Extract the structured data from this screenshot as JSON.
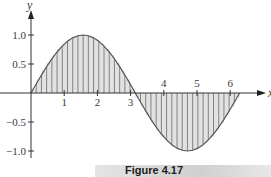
{
  "chart_data": {
    "type": "area",
    "title": "",
    "function": "sin(x)",
    "xlabel": "x",
    "ylabel": "y",
    "xlim": [
      0,
      6.283
    ],
    "ylim": [
      -1.0,
      1.0
    ],
    "x_ticks": [
      1,
      2,
      3,
      4,
      5,
      6
    ],
    "x_tick_labels": [
      "1",
      "2",
      "3",
      "4",
      "5",
      "6"
    ],
    "y_ticks": [
      1.0,
      0.5,
      -0.5,
      -1.0
    ],
    "y_tick_labels": [
      "1.0",
      "0.5",
      "−0.5",
      "−1.0"
    ],
    "num_strips": 40,
    "grid": false,
    "legend": null,
    "fill": "vertical strips between curve and x-axis",
    "x": [
      0,
      0.785,
      1.571,
      2.356,
      3.142,
      3.927,
      4.712,
      5.498,
      6.283
    ],
    "values": [
      0,
      0.707,
      1.0,
      0.707,
      0,
      -0.707,
      -1.0,
      -0.707,
      0
    ]
  },
  "caption": "Figure 4.17",
  "colors": {
    "curve": "#555555",
    "fill": "#e2e2e2",
    "strip_lines": "#6a6a6a",
    "axes": "#333333"
  }
}
